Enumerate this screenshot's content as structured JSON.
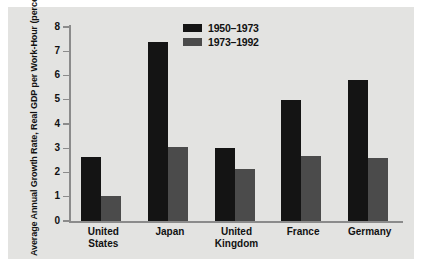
{
  "chart_data": {
    "type": "bar",
    "title": "",
    "xlabel": "",
    "ylabel": "Average Annual Growth Rate,\nReal GDP per Work-Hour\n(percent)",
    "categories": [
      "United\nStates",
      "Japan",
      "United\nKingdom",
      "France",
      "Germany"
    ],
    "series": [
      {
        "name": "1950-1973",
        "color": "#141414",
        "values": [
          2.65,
          7.4,
          3.0,
          5.0,
          5.8
        ]
      },
      {
        "name": "1973-1992",
        "color": "#4b4b4b",
        "values": [
          1.05,
          3.05,
          2.15,
          2.7,
          2.6
        ]
      }
    ],
    "ylim": [
      0,
      8
    ],
    "yticks": [
      "0",
      "1",
      "2",
      "3",
      "4",
      "5",
      "6",
      "7",
      "8"
    ],
    "grid": false,
    "legend_position": "top-center"
  },
  "legend": {
    "items": [
      {
        "label": "1950–1973",
        "swatch": "dark"
      },
      {
        "label": "1973–1992",
        "swatch": "light"
      }
    ]
  },
  "colors": {
    "background": "#ffffff",
    "panel": "#e3e3e1",
    "axis": "#8b8b8b",
    "series_1": "#141414",
    "series_2": "#4b4b4b",
    "text": "#111111"
  }
}
